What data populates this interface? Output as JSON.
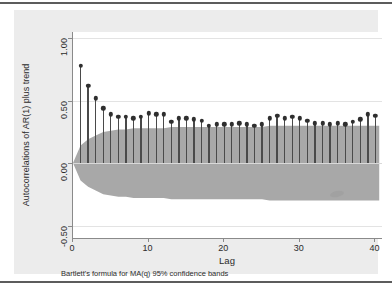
{
  "chart_data": {
    "type": "bar",
    "title": "",
    "xlabel": "Lag",
    "ylabel": "Autocorrelations of AR(1) plus trend",
    "note": "Bartlett's formula for MA(q) 95% confidence bands",
    "xlim": [
      0,
      41
    ],
    "ylim": [
      -0.6,
      1.05
    ],
    "xticks": [
      0,
      10,
      20,
      30,
      40
    ],
    "xticklabels": [
      "0",
      "10",
      "20",
      "30",
      "40"
    ],
    "yticks": [
      1.0,
      0.5,
      0.0,
      -0.5
    ],
    "yticklabels": [
      "1.00",
      "0.50",
      "0.00",
      "-0.50"
    ],
    "grid": true,
    "legend": "none",
    "series_name": "Autocorrelation",
    "categories": [
      1,
      2,
      3,
      4,
      5,
      6,
      7,
      8,
      9,
      10,
      11,
      12,
      13,
      14,
      15,
      16,
      17,
      18,
      19,
      20,
      21,
      22,
      23,
      24,
      25,
      26,
      27,
      28,
      29,
      30,
      31,
      32,
      33,
      34,
      35,
      36,
      37,
      38,
      39,
      40
    ],
    "values": [
      0.78,
      0.62,
      0.52,
      0.44,
      0.39,
      0.37,
      0.37,
      0.36,
      0.37,
      0.4,
      0.39,
      0.39,
      0.33,
      0.36,
      0.36,
      0.35,
      0.34,
      0.3,
      0.31,
      0.31,
      0.31,
      0.32,
      0.31,
      0.3,
      0.31,
      0.36,
      0.38,
      0.36,
      0.37,
      0.36,
      0.34,
      0.32,
      0.32,
      0.31,
      0.32,
      0.31,
      0.33,
      0.35,
      0.39,
      0.38
    ],
    "confidence_band": {
      "label": "Bartlett 95% confidence band",
      "color": "#a8a8a8",
      "upper": [
        0.14,
        0.19,
        0.22,
        0.25,
        0.26,
        0.27,
        0.27,
        0.28,
        0.28,
        0.28,
        0.28,
        0.28,
        0.29,
        0.29,
        0.29,
        0.29,
        0.29,
        0.29,
        0.29,
        0.29,
        0.29,
        0.29,
        0.29,
        0.29,
        0.29,
        0.3,
        0.3,
        0.3,
        0.3,
        0.3,
        0.3,
        0.3,
        0.3,
        0.3,
        0.3,
        0.3,
        0.3,
        0.3,
        0.3,
        0.3
      ],
      "lower": [
        -0.14,
        -0.19,
        -0.22,
        -0.25,
        -0.26,
        -0.27,
        -0.27,
        -0.28,
        -0.28,
        -0.28,
        -0.28,
        -0.28,
        -0.29,
        -0.29,
        -0.29,
        -0.29,
        -0.29,
        -0.29,
        -0.29,
        -0.29,
        -0.29,
        -0.29,
        -0.29,
        -0.29,
        -0.29,
        -0.3,
        -0.3,
        -0.3,
        -0.3,
        -0.3,
        -0.3,
        -0.3,
        -0.3,
        -0.3,
        -0.3,
        -0.3,
        -0.3,
        -0.3,
        -0.3,
        -0.3
      ]
    },
    "colors": {
      "spike": "#4a4a4a",
      "marker": "#2f2f2f",
      "band": "#a8a8a8",
      "plot_background": "#ffffff",
      "graph_background": "#ececec",
      "gridline": "#e3e3e3",
      "axis": "#8a8a8a"
    }
  }
}
